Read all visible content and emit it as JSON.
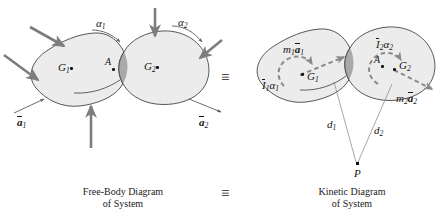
{
  "figure": {
    "type": "engineering-mechanics-diagram",
    "equivalence_symbol": "≡"
  },
  "colors": {
    "body_fill": "#ececec",
    "body_stroke": "#3a3a3a",
    "overlap_fill": "#a8a8a8",
    "force_arrow": "#7d7d7d",
    "dashed_arrow": "#8a8a8a",
    "thin_line": "#6e6e6e",
    "text": "#151515",
    "background": "#ffffff"
  },
  "free_body_diagram": {
    "caption_line1": "Free-Body Diagram",
    "caption_line2": "of System",
    "center_of_mass_1": "G",
    "center_of_mass_1_sub": "1",
    "center_of_mass_2": "G",
    "center_of_mass_2_sub": "2",
    "contact_point": "A",
    "angular_accel_1": "α",
    "angular_accel_1_sub": "1",
    "angular_accel_2": "α",
    "angular_accel_2_sub": "2",
    "accel_1_symbol": "a",
    "accel_1_sub": "1",
    "accel_2_symbol": "a",
    "accel_2_sub": "2",
    "force_arrow_count": 5
  },
  "kinetic_diagram": {
    "caption_line1": "Kinetic Diagram",
    "caption_line2": "of System",
    "center_of_mass_1": "G",
    "center_of_mass_1_sub": "1",
    "center_of_mass_2": "G",
    "center_of_mass_2_sub": "2",
    "contact_point": "A",
    "inertia_moment_1_I": "I",
    "inertia_moment_1_sub": "1",
    "inertia_moment_1_alpha": "α",
    "inertia_moment_1_alpha_sub": "1",
    "inertia_moment_2_I": "I",
    "inertia_moment_2_sub": "2",
    "inertia_moment_2_alpha": "α",
    "inertia_moment_2_alpha_sub": "2",
    "mass_accel_1_m": "m",
    "mass_accel_1_m_sub": "1",
    "mass_accel_1_a": "a",
    "mass_accel_1_a_sub": "1",
    "mass_accel_2_m": "m",
    "mass_accel_2_m_sub": "2",
    "mass_accel_2_a": "a",
    "mass_accel_2_a_sub": "2",
    "distance_1": "d",
    "distance_1_sub": "1",
    "distance_2": "d",
    "distance_2_sub": "2",
    "reference_point": "P"
  }
}
